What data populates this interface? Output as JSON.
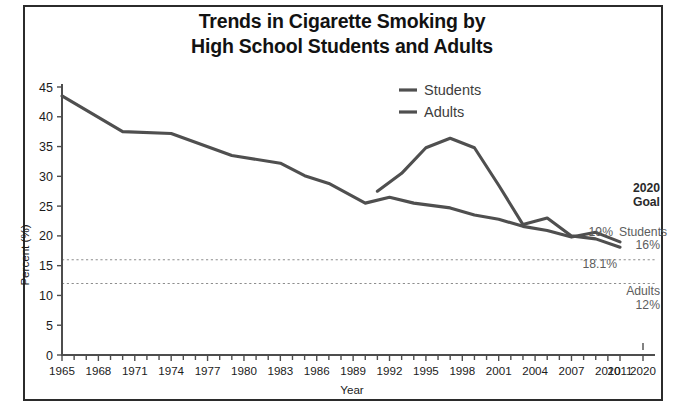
{
  "figure": {
    "title_line1": "Trends in Cigarette Smoking by",
    "title_line2": "High School Students and Adults",
    "border_color": "#2b2b2b",
    "background": "#ffffff"
  },
  "legend": {
    "position": "top-center-right",
    "entries": [
      {
        "label": "Students",
        "color": "#4f4f4f"
      },
      {
        "label": "Adults",
        "color": "#4f4f4f"
      }
    ]
  },
  "annotations": {
    "goal_heading_line1": "2020",
    "goal_heading_line2": "Goal",
    "students_end_value": "19%",
    "students_goal_label": "Students",
    "students_goal_value": "16%",
    "adults_end_value": "18.1%",
    "adults_goal_label": "Adults",
    "adults_goal_value": "12%"
  },
  "chart_data": {
    "type": "line",
    "title": "Trends in Cigarette Smoking by High School Students and Adults",
    "xlabel": "Year",
    "ylabel": "Percent (%)",
    "xlim": [
      1965,
      2020
    ],
    "ylim": [
      0,
      45
    ],
    "ytick_step": 5,
    "yticks": [
      0,
      5,
      10,
      15,
      20,
      25,
      30,
      35,
      40,
      45
    ],
    "xticks": [
      1965,
      1968,
      1971,
      1974,
      1977,
      1980,
      1983,
      1986,
      1989,
      1992,
      1995,
      1998,
      2001,
      2004,
      2007,
      2010,
      2011,
      2020
    ],
    "xtick_labels": [
      "1965",
      "1968",
      "1971",
      "1974",
      "1977",
      "1980",
      "1983",
      "1986",
      "1989",
      "1992",
      "1995",
      "1998",
      "2001",
      "2004",
      "2007",
      "2010",
      "2011",
      "2020"
    ],
    "grid": false,
    "minor_xticks_every": 1,
    "legend_position": "upper center",
    "line_color": "#4f4f4f",
    "series": [
      {
        "name": "Adults",
        "x": [
          1965,
          1970,
          1974,
          1979,
          1983,
          1985,
          1987,
          1990,
          1992,
          1994,
          1997,
          1999,
          2001,
          2003,
          2005,
          2007,
          2009,
          2011
        ],
        "values": [
          43.5,
          37.5,
          37.2,
          33.5,
          32.2,
          30.1,
          28.8,
          25.5,
          26.5,
          25.5,
          24.7,
          23.5,
          22.8,
          21.6,
          20.9,
          19.8,
          20.6,
          19.0
        ]
      },
      {
        "name": "Students",
        "x": [
          1991,
          1993,
          1995,
          1997,
          1999,
          2001,
          2003,
          2005,
          2007,
          2009,
          2011
        ],
        "values": [
          27.5,
          30.5,
          34.8,
          36.4,
          34.8,
          28.5,
          21.9,
          23.0,
          20.0,
          19.5,
          18.1
        ]
      }
    ],
    "reference_lines": [
      {
        "label": "Students 2020 goal",
        "value": 16,
        "style": "dashed"
      },
      {
        "label": "Adults 2020 goal",
        "value": 12,
        "style": "dashed"
      }
    ],
    "endpoint_labels": [
      {
        "series": "Students",
        "text": "19%",
        "value": 19
      },
      {
        "series": "Adults",
        "text": "18.1%",
        "value": 18.1
      }
    ]
  }
}
